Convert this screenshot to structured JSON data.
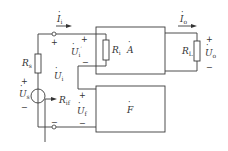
{
  "diagram": {
    "type": "negative-feedback-amplifier-block-diagram",
    "labels": {
      "input_current": {
        "main": "I",
        "sub": "i"
      },
      "output_current": {
        "main": "I",
        "sub": "o"
      },
      "source_resistance": {
        "main": "R",
        "sub": "s"
      },
      "source_voltage": {
        "main": "U",
        "sub": "s"
      },
      "input_voltage": {
        "main": "U",
        "sub": "i"
      },
      "net_input_voltage": {
        "main": "U",
        "sub": "i",
        "prime": "′"
      },
      "feedback_voltage": {
        "main": "U",
        "sub": "f"
      },
      "output_voltage": {
        "main": "U",
        "sub": "o"
      },
      "input_resistance": {
        "main": "R",
        "sub": "i"
      },
      "input_resistance_with_feedback": {
        "main": "R",
        "sub": "if"
      },
      "load_resistance": {
        "main": "R",
        "sub": "L"
      },
      "amplifier_block": {
        "main": "A"
      },
      "feedback_block": {
        "main": "F"
      }
    },
    "signs": {
      "plus": "+",
      "minus": "−"
    },
    "colors": {
      "line": "#3a3a3a",
      "text": "#333333",
      "background": "#ffffff"
    }
  }
}
